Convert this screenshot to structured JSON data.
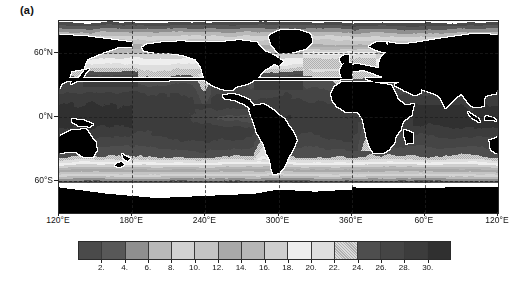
{
  "figure": {
    "panel_label": "(a)",
    "background": "#ffffff"
  },
  "chart_data": {
    "type": "heatmap",
    "title": "(a)",
    "subtitle": "",
    "xlabel": "",
    "ylabel": "",
    "projection": "cylindrical equidistant (Pacific-centred)",
    "grid": true,
    "legend_position": "bottom",
    "xlim": [
      120,
      480
    ],
    "ylim": [
      -90,
      90
    ],
    "x_tick_labels": [
      "120°E",
      "180°E",
      "240°E",
      "300°E",
      "360°E",
      "60°E",
      "120°E"
    ],
    "x_tick_values": [
      120,
      180,
      240,
      300,
      360,
      420,
      480
    ],
    "y_tick_labels": [
      "60°N",
      "0°N",
      "60°S"
    ],
    "y_tick_values": [
      60,
      0,
      -60
    ],
    "gridlines_x": [
      180,
      240,
      300,
      360,
      420
    ],
    "gridlines_y": [
      60,
      0,
      -60
    ],
    "land_color": "#000000",
    "missing_color": "#ffffff",
    "colorbar": {
      "orientation": "horizontal",
      "n_levels": 16,
      "vmin": 0,
      "vmax": 32,
      "step": 2,
      "tick_labels": [
        "2.",
        "4.",
        "6.",
        "8.",
        "10.",
        "12.",
        "14.",
        "16.",
        "18.",
        "20.",
        "22.",
        "24.",
        "26.",
        "28.",
        "30."
      ],
      "tick_values": [
        2,
        4,
        6,
        8,
        10,
        12,
        14,
        16,
        18,
        20,
        22,
        24,
        26,
        28,
        30
      ],
      "cell_colors": [
        "#4a4a4a",
        "#585858",
        "#8f8f8f",
        "#b9b9b9",
        "#d2d2d2",
        "#c4c4c4",
        "#a9a9a9",
        "#b6b6b6",
        "#cfcfcf",
        "#eeeeee",
        "#dedede",
        "#b0b0b0",
        "#4e4e4e",
        "#454545",
        "#3c3c3c",
        "#303030"
      ],
      "cell_ranges": [
        "0-2",
        "2-4",
        "4-6",
        "6-8",
        "8-10",
        "10-12",
        "12-14",
        "14-16",
        "16-18",
        "18-20",
        "20-22",
        "22-24",
        "24-26",
        "26-28",
        "28-30",
        "30-32"
      ]
    }
  }
}
